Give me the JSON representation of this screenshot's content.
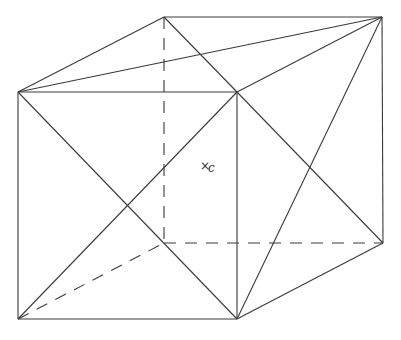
{
  "diagram": {
    "type": "cube-wireframe-with-face-diagonals",
    "vertices": {
      "front_top_left": [
        18,
        92
      ],
      "front_top_right": [
        237,
        92
      ],
      "front_bottom_right": [
        237,
        319
      ],
      "front_bottom_left": [
        18,
        319
      ],
      "back_top_left": [
        164,
        17
      ],
      "back_top_right": [
        382,
        17
      ],
      "back_bottom_right": [
        383,
        243
      ],
      "back_bottom_left": [
        164,
        243
      ]
    },
    "solid_edges": [
      [
        18,
        92,
        237,
        92
      ],
      [
        237,
        92,
        237,
        319
      ],
      [
        237,
        319,
        18,
        319
      ],
      [
        18,
        319,
        18,
        92
      ],
      [
        18,
        92,
        164,
        17
      ],
      [
        164,
        17,
        382,
        17
      ],
      [
        237,
        92,
        382,
        17
      ],
      [
        382,
        17,
        383,
        243
      ],
      [
        237,
        319,
        383,
        243
      ]
    ],
    "solid_diagonals": [
      [
        18,
        92,
        237,
        319
      ],
      [
        237,
        92,
        18,
        319
      ],
      [
        18,
        92,
        382,
        17
      ],
      [
        164,
        17,
        237,
        92
      ],
      [
        237,
        92,
        383,
        243
      ],
      [
        382,
        17,
        237,
        319
      ]
    ],
    "dashed_edges": [
      [
        164,
        17,
        164,
        243
      ],
      [
        164,
        243,
        383,
        243
      ],
      [
        18,
        319,
        164,
        243
      ]
    ],
    "center_label": {
      "marker": "×",
      "text": "c",
      "x": 200,
      "y": 170
    }
  }
}
